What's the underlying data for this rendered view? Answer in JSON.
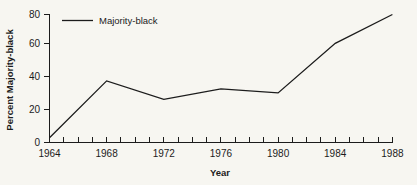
{
  "chart_data": {
    "type": "line",
    "title": "",
    "xlabel": "Year",
    "ylabel": "Percent Majority-black",
    "xlim": [
      1964,
      1988
    ],
    "ylim": [
      0,
      80
    ],
    "grid": false,
    "legend_position": "top-left",
    "x_tick_interval": 1,
    "x_label_interval": 4,
    "y_tick_interval": 20,
    "xticklabels": [
      "1964",
      "1968",
      "1972",
      "1976",
      "1980",
      "1984",
      "1988"
    ],
    "xtickvalues": [
      1964,
      1968,
      1972,
      1976,
      1980,
      1984,
      1988
    ],
    "yticklabels": [
      "0",
      "20",
      "40",
      "60",
      "80"
    ],
    "ytickvalues": [
      0,
      20,
      40,
      60,
      80
    ],
    "x": [
      1964,
      1968,
      1972,
      1976,
      1980,
      1984,
      1988
    ],
    "series": [
      {
        "name": "Majority-black",
        "values": [
          3,
          38.5,
          27,
          33.5,
          31,
          62,
          80
        ],
        "color": "#1c1c1c"
      }
    ]
  },
  "legend": {
    "entries": [
      {
        "label": "Majority-black"
      }
    ]
  },
  "axes": {
    "y_title": "Percent Majority-black",
    "x_title": "Year",
    "y_labels": {
      "t0": "0",
      "t1": "20",
      "t2": "40",
      "t3": "60",
      "t4": "80"
    },
    "x_labels": {
      "t0": "1964",
      "t1": "1968",
      "t2": "1972",
      "t3": "1976",
      "t4": "1980",
      "t5": "1984",
      "t6": "1988"
    }
  }
}
